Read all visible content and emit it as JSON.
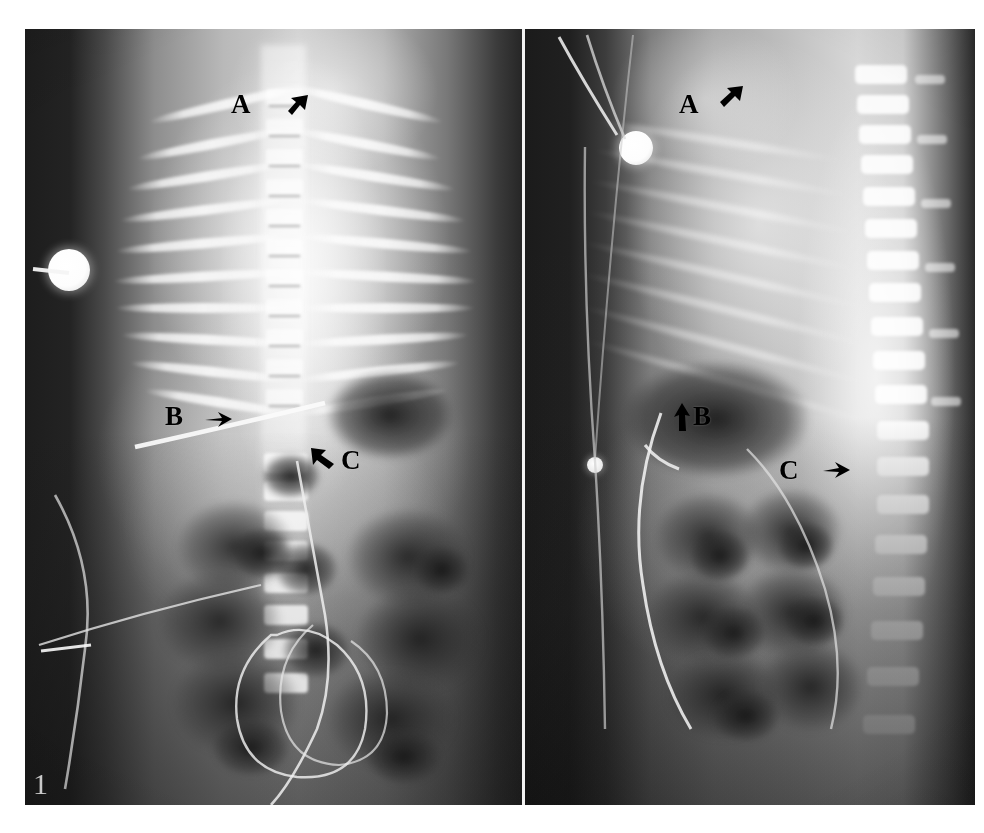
{
  "figure": {
    "number_label": "1",
    "panels": [
      {
        "id": "ap",
        "view_name": "anteroposterior",
        "annotations": [
          {
            "letter": "A",
            "arrow": "arrow-down-left-icon"
          },
          {
            "letter": "B",
            "arrow": "arrow-right-icon"
          },
          {
            "letter": "C",
            "arrow": "arrow-up-left-icon"
          }
        ],
        "devices": [
          {
            "name": "ecg-electrode"
          },
          {
            "name": "umbilical-catheter"
          },
          {
            "name": "monitoring-lead-wire"
          }
        ]
      },
      {
        "id": "lateral",
        "view_name": "lateral",
        "annotations": [
          {
            "letter": "A",
            "arrow": "arrow-up-right-icon"
          },
          {
            "letter": "B",
            "arrow": "arrow-up-icon"
          },
          {
            "letter": "C",
            "arrow": "arrow-right-icon"
          }
        ],
        "devices": [
          {
            "name": "ecg-electrode"
          },
          {
            "name": "monitoring-lead-wire"
          }
        ]
      }
    ]
  },
  "colors": {
    "page_background": "#ffffff",
    "film_dark": "#222222",
    "film_mid": "#8d8d8d",
    "film_bright": "#f4f4f4",
    "annotation_ink": "#000000",
    "figure_number_ink": "#e9e9e9",
    "panel_divider": "#f2f2f2"
  }
}
